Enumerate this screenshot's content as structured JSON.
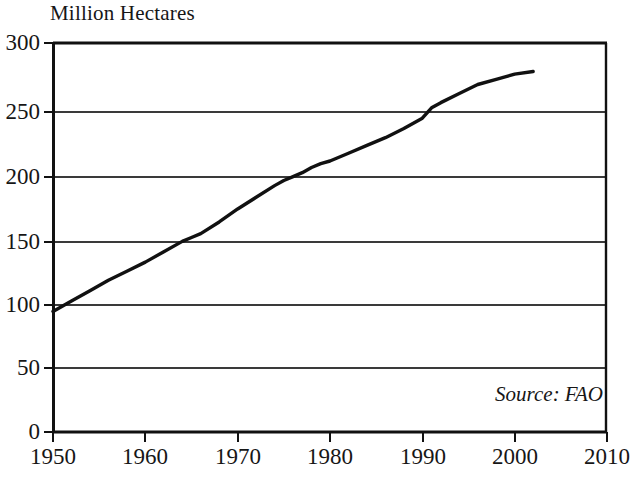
{
  "chart_data": {
    "type": "line",
    "title": "Million Hectares",
    "xlabel": "",
    "ylabel": "Million Hectares",
    "xlim": [
      1950,
      2010
    ],
    "ylim": [
      0,
      300
    ],
    "grid": true,
    "legend": false,
    "annotations": [
      "Source: FAO"
    ],
    "source": "Source: FAO",
    "y_ticks": [
      0,
      50,
      100,
      150,
      200,
      250,
      300
    ],
    "y_tick_labels": [
      "0",
      "50",
      "100",
      "150",
      "200",
      "250",
      "300"
    ],
    "x_ticks": [
      1950,
      1960,
      1970,
      1980,
      1990,
      2000,
      2010
    ],
    "x_tick_labels": [
      "1950",
      "1960",
      "1970",
      "1980",
      "1990",
      "2000",
      "2010"
    ],
    "series": [
      {
        "name": "Irrigated Area",
        "x": [
          1950,
          1952,
          1954,
          1956,
          1958,
          1960,
          1962,
          1964,
          1965,
          1966,
          1968,
          1970,
          1972,
          1974,
          1975,
          1976,
          1977,
          1978,
          1979,
          1980,
          1982,
          1984,
          1986,
          1988,
          1990,
          1991,
          1992,
          1994,
          1996,
          1998,
          2000,
          2002
        ],
        "y": [
          93,
          101,
          109,
          117,
          124,
          131,
          139,
          147,
          150,
          153,
          162,
          172,
          181,
          190,
          194,
          197,
          200,
          204,
          207,
          209,
          215,
          221,
          227,
          234,
          242,
          250,
          254,
          261,
          268,
          272,
          276,
          278
        ]
      }
    ]
  },
  "figure": {
    "title": "Million Hectares",
    "source_note": "Source: FAO"
  }
}
